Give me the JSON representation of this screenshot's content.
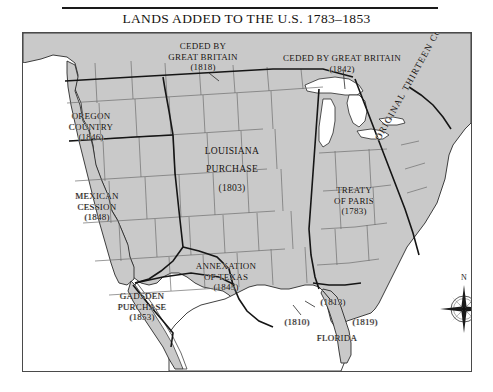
{
  "title": "LANDS ADDED TO THE U.S. 1783–1853",
  "map": {
    "frame_label": "united-states-territorial-acquisitions-map",
    "land_color": "#c9c9c9",
    "water_color": "#ffffff",
    "border_color": "#4a4a4a",
    "state_line_color": "#6f6f6f",
    "cession_line_color": "#1a1a1a"
  },
  "labels": {
    "ceded_british_1818": {
      "line1": "CEDED BY",
      "line2": "GREAT BRITAIN",
      "line3": "(1818)"
    },
    "ceded_british_1842": {
      "line1": "CEDED BY GREAT BRITAIN",
      "line2": "(1842)"
    },
    "oregon_country": {
      "line1": "OREGON",
      "line2": "COUNTRY",
      "line3": "(1846)"
    },
    "louisiana_purchase": {
      "line1": "LOUISIANA",
      "line2": "PURCHASE",
      "line3": "(1803)"
    },
    "mexican_cession": {
      "line1": "MEXICAN",
      "line2": "CESSION",
      "line3": "(1848)"
    },
    "treaty_of_paris": {
      "line1": "TREATY",
      "line2": "OF PARIS",
      "line3": "(1783)"
    },
    "original_colonies": {
      "text": "ORIGINAL THIRTEEN COLONIES"
    },
    "annexation_texas": {
      "line1": "ANNEXATION",
      "line2": "OF TEXAS",
      "line3": "(1845)"
    },
    "gadsden_purchase": {
      "line1": "GADSDEN",
      "line2": "PURCHASE",
      "line3": "(1853)"
    },
    "florida": {
      "date_1813": "(1813)",
      "date_1810": "(1810)",
      "date_1819": "(1819)",
      "name": "FLORIDA"
    }
  },
  "compass": {
    "north": "N"
  }
}
